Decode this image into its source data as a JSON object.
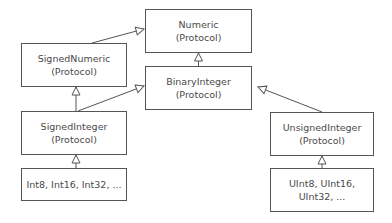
{
  "diagram": {
    "type": "uml-protocol-hierarchy",
    "nodes": [
      {
        "id": "numeric",
        "name": "Numeric",
        "stereotype": "(Protocol)"
      },
      {
        "id": "signed_numeric",
        "name": "SignedNumeric",
        "stereotype": "(Protocol)"
      },
      {
        "id": "binary_integer",
        "name": "BinaryInteger",
        "stereotype": "(Protocol)"
      },
      {
        "id": "signed_integer",
        "name": "SignedInteger",
        "stereotype": "(Protocol)"
      },
      {
        "id": "unsigned_integer",
        "name": "UnsignedInteger",
        "stereotype": "(Protocol)"
      },
      {
        "id": "int_types",
        "line1": "Int8, Int16, Int32, ..."
      },
      {
        "id": "uint_types",
        "line1": "UInt8, UInt16,",
        "line2": "UInt32, ..."
      }
    ],
    "edges": [
      {
        "from": "signed_numeric",
        "to": "numeric",
        "style": "hollow-triangle"
      },
      {
        "from": "binary_integer",
        "to": "numeric",
        "style": "hollow-triangle"
      },
      {
        "from": "signed_integer",
        "to": "signed_numeric",
        "style": "hollow-triangle"
      },
      {
        "from": "signed_integer",
        "to": "binary_integer",
        "style": "hollow-triangle"
      },
      {
        "from": "unsigned_integer",
        "to": "binary_integer",
        "style": "hollow-triangle"
      },
      {
        "from": "int_types",
        "to": "signed_integer",
        "style": "hollow-triangle"
      },
      {
        "from": "uint_types",
        "to": "unsigned_integer",
        "style": "hollow-triangle"
      }
    ],
    "colors": {
      "line": "#555555",
      "text": "#4a4a4a",
      "background": "#ffffff"
    }
  }
}
